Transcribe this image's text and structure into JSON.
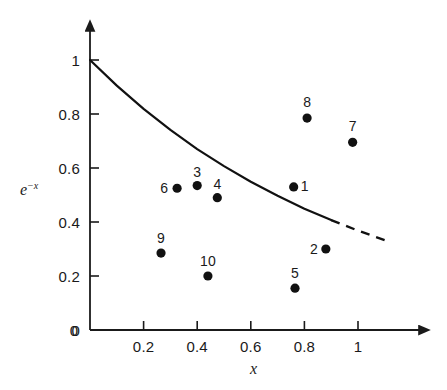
{
  "chart_data": {
    "type": "scatter",
    "title": "",
    "xlabel": "x",
    "ylabel": "e⁻ˣ",
    "ylabel_base": "e",
    "ylabel_exp": "−x",
    "xlim": [
      0,
      1.12
    ],
    "ylim": [
      0,
      1.06
    ],
    "grid": false,
    "legend": "none",
    "xticks": [
      0,
      0.2,
      0.4,
      0.6,
      0.8,
      1
    ],
    "xtick_labels": [
      "0",
      "0.2",
      "0.4",
      "0.6",
      "0.8",
      "1"
    ],
    "yticks": [
      0,
      0.2,
      0.4,
      0.6,
      0.8,
      1
    ],
    "ytick_labels": [
      "0",
      "0.2",
      "0.4",
      "0.6",
      "0.8",
      "1"
    ],
    "curve": {
      "name": "e^-x",
      "expression": "y = e^(-x)",
      "style": "solid-then-dashed",
      "solid_range": [
        0,
        0.9
      ],
      "dashed_range": [
        0.9,
        1.12
      ],
      "points": [
        {
          "x": 0.0,
          "y": 1.0
        },
        {
          "x": 0.1,
          "y": 0.905
        },
        {
          "x": 0.2,
          "y": 0.819
        },
        {
          "x": 0.3,
          "y": 0.741
        },
        {
          "x": 0.4,
          "y": 0.67
        },
        {
          "x": 0.5,
          "y": 0.607
        },
        {
          "x": 0.6,
          "y": 0.549
        },
        {
          "x": 0.7,
          "y": 0.497
        },
        {
          "x": 0.8,
          "y": 0.449
        },
        {
          "x": 0.9,
          "y": 0.407
        },
        {
          "x": 1.0,
          "y": 0.368
        },
        {
          "x": 1.12,
          "y": 0.326
        }
      ]
    },
    "series": [
      {
        "name": "observations",
        "marker": "filled-circle",
        "points": [
          {
            "label": "1",
            "x": 0.76,
            "y": 0.53,
            "label_dx": 11,
            "label_dy": -1
          },
          {
            "label": "2",
            "x": 0.88,
            "y": 0.3,
            "label_dx": -12,
            "label_dy": 0
          },
          {
            "label": "3",
            "x": 0.4,
            "y": 0.535,
            "label_dx": 0,
            "label_dy": -14
          },
          {
            "label": "4",
            "x": 0.475,
            "y": 0.49,
            "label_dx": 0,
            "label_dy": -14
          },
          {
            "label": "5",
            "x": 0.765,
            "y": 0.155,
            "label_dx": 0,
            "label_dy": -15
          },
          {
            "label": "6",
            "x": 0.325,
            "y": 0.525,
            "label_dx": -13,
            "label_dy": 0
          },
          {
            "label": "7",
            "x": 0.98,
            "y": 0.695,
            "label_dx": 0,
            "label_dy": -16
          },
          {
            "label": "8",
            "x": 0.81,
            "y": 0.785,
            "label_dx": 0,
            "label_dy": -16
          },
          {
            "label": "9",
            "x": 0.265,
            "y": 0.285,
            "label_dx": 0,
            "label_dy": -15
          },
          {
            "label": "10",
            "x": 0.44,
            "y": 0.2,
            "label_dx": 0,
            "label_dy": -15
          }
        ]
      }
    ]
  },
  "figure": {
    "axis_color": "#1a1a1a",
    "curve_color": "#111111",
    "marker_color": "#111111",
    "background": "#ffffff"
  }
}
